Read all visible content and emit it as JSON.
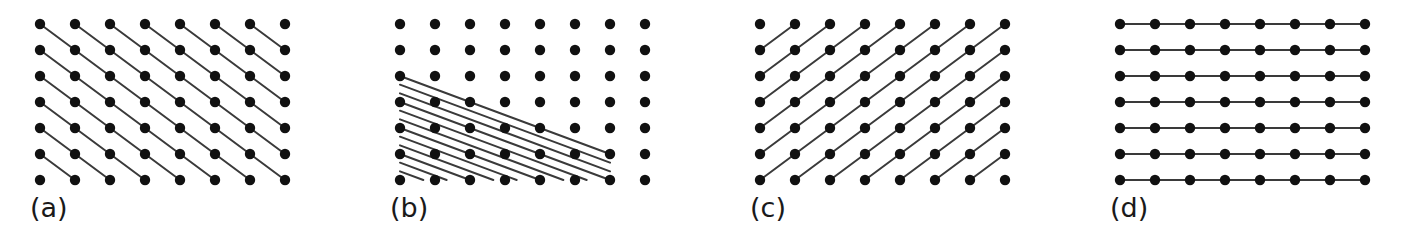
{
  "figure": {
    "background_color": "#ffffff",
    "dot_color": "#111111",
    "line_color": "#3a3a3a",
    "label_color": "#1a1a1a",
    "dot_radius": 5.2,
    "line_width": 2.0,
    "lattice": {
      "columns": 8,
      "rows": 7,
      "x_start": 40,
      "y_start": 24,
      "x_spacing": 35,
      "y_spacing": 26
    }
  },
  "panels": [
    {
      "id": "a",
      "label": "(a)",
      "left": 0,
      "planes": {
        "description": "diagonal planes descending to the right through nearest-neighbour lattice points",
        "direction": "down-right",
        "step_cols": 1,
        "step_rows": 1,
        "interline_divisions": 1,
        "family": "(110)"
      }
    },
    {
      "id": "b",
      "label": "(b)",
      "left": 360,
      "planes": {
        "description": "closely spaced shallow planes descending to the right, confined to a triangular region in the lower-left",
        "direction": "down-right",
        "step_cols": 2,
        "step_rows": 1,
        "interline_divisions": 3,
        "family": "(210)"
      }
    },
    {
      "id": "c",
      "label": "(c)",
      "left": 720,
      "planes": {
        "description": "diagonal planes ascending to the right through nearest-neighbour lattice points",
        "direction": "up-right",
        "step_cols": 1,
        "step_rows": -1,
        "interline_divisions": 1,
        "family": "(1-10)"
      }
    },
    {
      "id": "d",
      "label": "(d)",
      "left": 1080,
      "planes": {
        "description": "horizontal planes through every row of lattice points",
        "direction": "horizontal",
        "step_cols": 1,
        "step_rows": 0,
        "interline_divisions": 1,
        "family": "(100)"
      }
    }
  ]
}
